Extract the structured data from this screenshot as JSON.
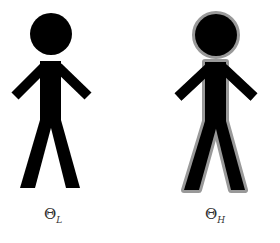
{
  "figures": [
    {
      "id": "left",
      "label_main": "Θ",
      "label_sub": "L",
      "outline": "none",
      "fill": "#000000"
    },
    {
      "id": "right",
      "label_main": "Θ",
      "label_sub": "H",
      "outline": "#999999",
      "fill": "#000000"
    }
  ],
  "footer_text": ""
}
